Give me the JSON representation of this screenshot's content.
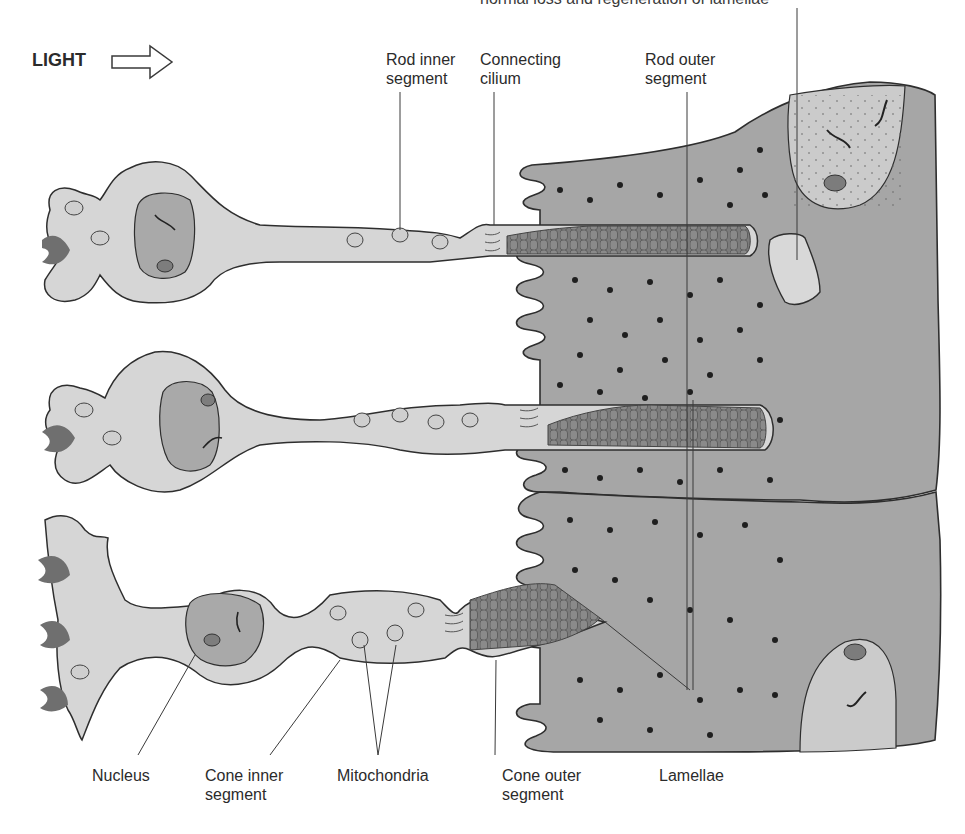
{
  "figure": {
    "top_caption_partial": "normal loss and regeneration of lamellae",
    "light_label": "LIGHT",
    "light_arrow_icon": "right-arrow-outline"
  },
  "labels": {
    "rod_inner_segment": "Rod inner\nsegment",
    "connecting_cilium": "Connecting\ncilium",
    "rod_outer_segment": "Rod outer\nsegment",
    "nucleus": "Nucleus",
    "cone_inner_segment": "Cone inner\nsegment",
    "mitochondria": "Mitochondria",
    "cone_outer_segment": "Cone outer\nsegment",
    "lamellae": "Lamellae"
  },
  "colors": {
    "cell_cytoplasm": "#d6d6d6",
    "nucleus_fill": "#a8a8a8",
    "epithelium": "#a6a6a6",
    "epithelium_nucleus_region": "#cacaca",
    "lamellae_fill": "#7a7a7a",
    "synapse": "#6e6e6e",
    "outline": "#2e2e2e",
    "pigment_granule": "#1e1e1e"
  }
}
